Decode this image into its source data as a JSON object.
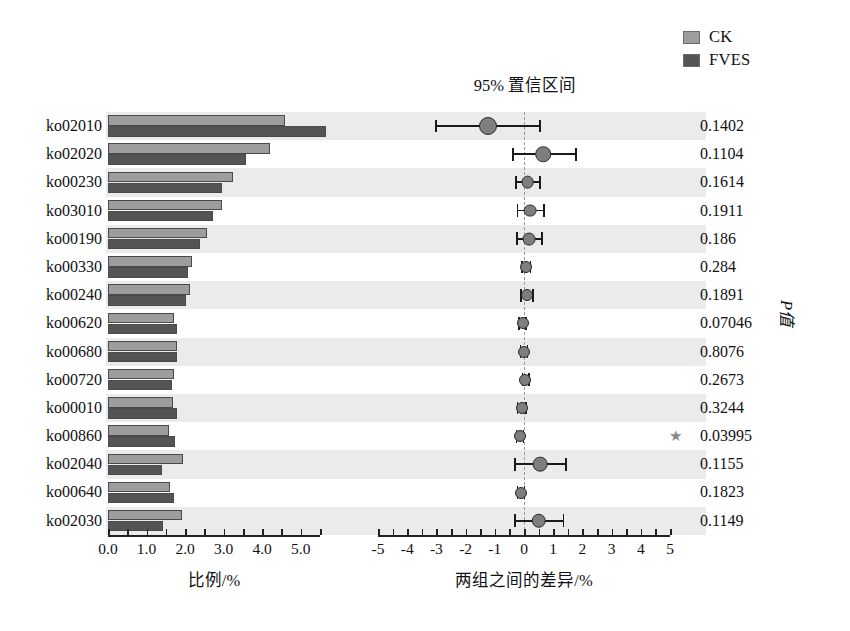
{
  "legend": {
    "items": [
      {
        "label": "CK",
        "color": "#9d9d9d"
      },
      {
        "label": "FVES",
        "color": "#545454"
      }
    ]
  },
  "ci_panel": {
    "title": "95% 置信区间"
  },
  "pvalue_axis_title": "P值",
  "significance_marker": "★",
  "chart_data": {
    "type": "bar",
    "title": "",
    "subtitle": "",
    "panels": [
      {
        "name": "proportion",
        "type": "bar",
        "xlabel": "比例/%",
        "xlim": [
          0.0,
          5.5
        ],
        "xticks": [
          0.0,
          0.5,
          1.0,
          1.5,
          2.0,
          2.5,
          3.0,
          3.5,
          4.0,
          4.5,
          5.0,
          5.5
        ],
        "xtick_labels": [
          "0.0",
          "",
          "1.0",
          "",
          "2.0",
          "",
          "3.0",
          "",
          "4.0",
          "",
          "5.0",
          ""
        ],
        "grid": false,
        "legend_position": "top-right"
      },
      {
        "name": "confidence_interval",
        "type": "scatter",
        "title": "95% 置信区间",
        "xlabel": "两组之间的差异/%",
        "xlim": [
          -5,
          5
        ],
        "xticks": [
          -5,
          -4.5,
          -4,
          -3.5,
          -3,
          -2.5,
          -2,
          -1.5,
          -1,
          -0.5,
          0,
          0.5,
          1,
          1.5,
          2,
          2.5,
          3,
          3.5,
          4,
          4.5,
          5
        ],
        "xtick_labels": [
          "-5",
          "",
          "-4",
          "",
          "-3",
          "",
          "-2",
          "",
          "-1",
          "",
          "0",
          "",
          "1",
          "",
          "2",
          "",
          "3",
          "",
          "4",
          "",
          "5"
        ],
        "grid": false,
        "zero_reference_line": 0
      }
    ],
    "categories": [
      "ko02010",
      "ko02020",
      "ko00230",
      "ko03010",
      "ko00190",
      "ko00330",
      "ko00240",
      "ko00620",
      "ko00680",
      "ko00720",
      "ko00010",
      "ko00860",
      "ko02040",
      "ko00640",
      "ko02030"
    ],
    "series": [
      {
        "name": "CK",
        "color": "#9d9d9d",
        "values": [
          4.6,
          4.2,
          3.25,
          2.95,
          2.58,
          2.18,
          2.13,
          1.72,
          1.78,
          1.72,
          1.68,
          1.57,
          1.95,
          1.62,
          1.92
        ]
      },
      {
        "name": "FVES",
        "color": "#545454",
        "values": [
          5.65,
          3.58,
          2.95,
          2.72,
          2.38,
          2.08,
          2.03,
          1.8,
          1.78,
          1.65,
          1.78,
          1.73,
          1.4,
          1.72,
          1.42
        ]
      }
    ],
    "confidence_intervals": [
      {
        "category": "ko02010",
        "mean": -1.25,
        "low": -3.02,
        "high": 0.55
      },
      {
        "category": "ko02020",
        "mean": 0.65,
        "low": -0.38,
        "high": 1.78
      },
      {
        "category": "ko00230",
        "mean": 0.12,
        "low": -0.28,
        "high": 0.55
      },
      {
        "category": "ko03010",
        "mean": 0.22,
        "low": -0.22,
        "high": 0.68
      },
      {
        "category": "ko00190",
        "mean": 0.18,
        "low": -0.25,
        "high": 0.62
      },
      {
        "category": "ko00330",
        "mean": 0.08,
        "low": -0.08,
        "high": 0.22
      },
      {
        "category": "ko00240",
        "mean": 0.1,
        "low": -0.1,
        "high": 0.32
      },
      {
        "category": "ko00620",
        "mean": -0.05,
        "low": -0.16,
        "high": 0.07
      },
      {
        "category": "ko00680",
        "mean": 0.0,
        "low": -0.12,
        "high": 0.12
      },
      {
        "category": "ko00720",
        "mean": 0.05,
        "low": -0.05,
        "high": 0.16
      },
      {
        "category": "ko00010",
        "mean": -0.08,
        "low": -0.22,
        "high": 0.06
      },
      {
        "category": "ko00860",
        "mean": -0.14,
        "low": -0.26,
        "high": -0.02
      },
      {
        "category": "ko02040",
        "mean": 0.55,
        "low": -0.3,
        "high": 1.45
      },
      {
        "category": "ko00640",
        "mean": -0.1,
        "low": -0.22,
        "high": 0.02
      },
      {
        "category": "ko02030",
        "mean": 0.5,
        "low": -0.32,
        "high": 1.35
      }
    ],
    "pvalues": [
      {
        "category": "ko02010",
        "text": "0.1402",
        "significant": false
      },
      {
        "category": "ko02020",
        "text": "0.1104",
        "significant": false
      },
      {
        "category": "ko00230",
        "text": "0.1614",
        "significant": false
      },
      {
        "category": "ko03010",
        "text": "0.1911",
        "significant": false
      },
      {
        "category": "ko00190",
        "text": "0.186",
        "significant": false
      },
      {
        "category": "ko00330",
        "text": "0.284",
        "significant": false
      },
      {
        "category": "ko00240",
        "text": "0.1891",
        "significant": false
      },
      {
        "category": "ko00620",
        "text": "0.07046",
        "significant": false
      },
      {
        "category": "ko00680",
        "text": "0.8076",
        "significant": false
      },
      {
        "category": "ko00720",
        "text": "0.2673",
        "significant": false
      },
      {
        "category": "ko00010",
        "text": "0.3244",
        "significant": false
      },
      {
        "category": "ko00860",
        "text": "0.03995",
        "significant": true
      },
      {
        "category": "ko02040",
        "text": "0.1155",
        "significant": false
      },
      {
        "category": "ko00640",
        "text": "0.1823",
        "significant": false
      },
      {
        "category": "ko02030",
        "text": "0.1149",
        "significant": false
      }
    ]
  }
}
